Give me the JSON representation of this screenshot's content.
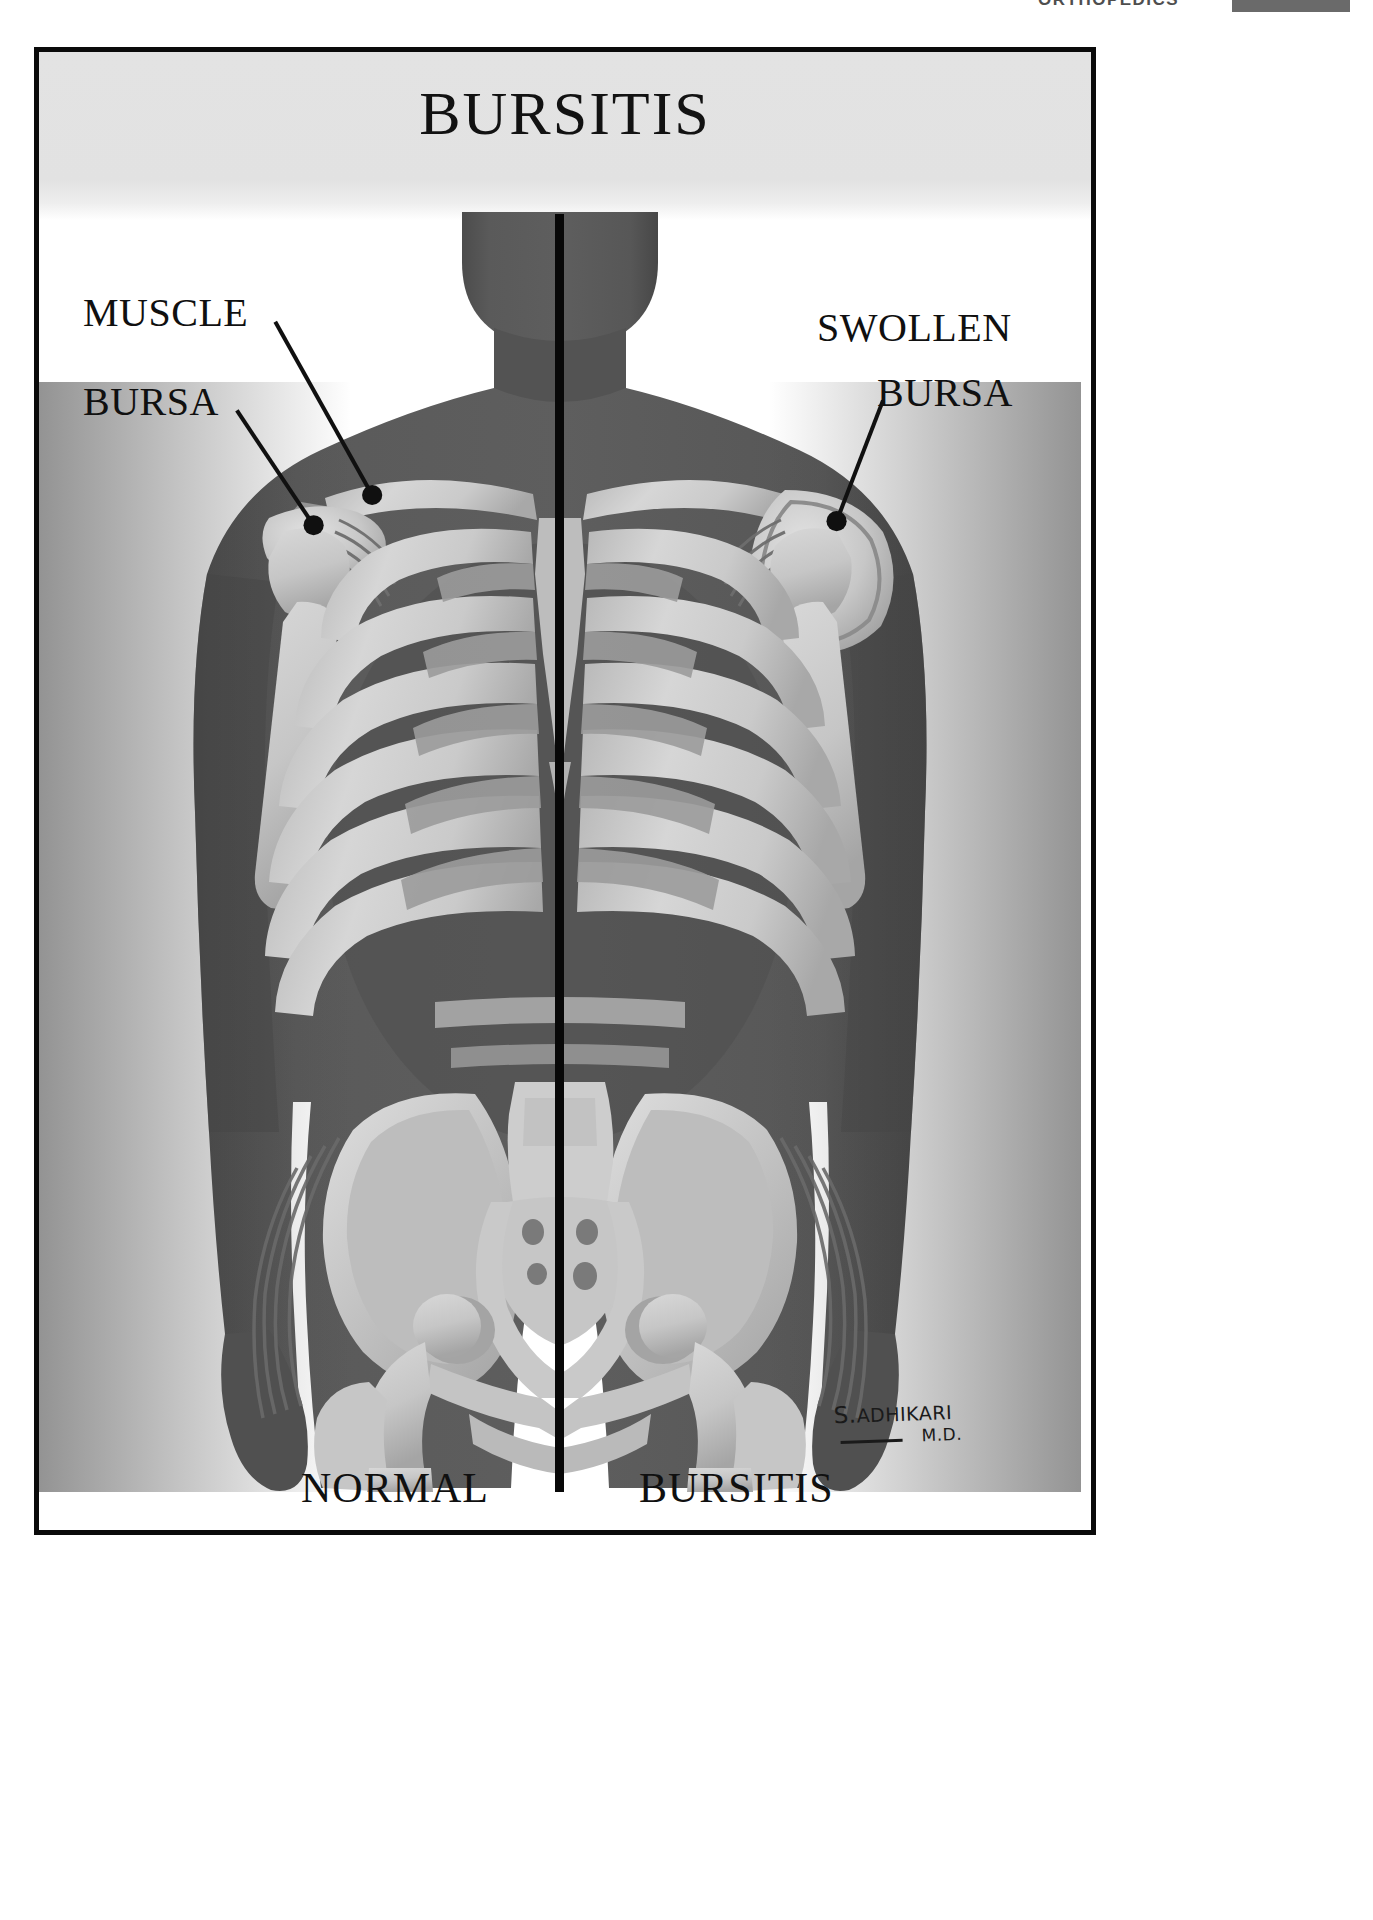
{
  "page_header": {
    "section_label": "ORTHOPEDICS",
    "page_number": "77"
  },
  "poster": {
    "title": "BURSITIS",
    "callouts": [
      {
        "id": "muscle",
        "label": "MUSCLE",
        "side": "left",
        "points_to": "deltoid-muscle"
      },
      {
        "id": "bursa",
        "label": "BURSA",
        "side": "left",
        "points_to": "normal-subacromial-bursa"
      },
      {
        "id": "swollen",
        "label": "SWOLLEN",
        "side": "right",
        "points_to": "swollen-bursa"
      },
      {
        "id": "swollen_bursa",
        "label": "BURSA",
        "side": "right",
        "points_to": "swollen-bursa"
      }
    ],
    "captions": {
      "left": "NORMAL",
      "right": "BURSITIS"
    },
    "signature": {
      "name_initial": "S.",
      "name_surname": "ADHIKARI",
      "degree": "M.D."
    }
  },
  "colors": {
    "frame": "#0a0a0a",
    "title_band": "#e2e2e2",
    "body_silhouette": "#565656",
    "body_shadow": "#3f3f3f",
    "bone_light": "#d2d2d2",
    "bone_mid": "#b6b6b6",
    "bone_dark": "#9a9a9a",
    "muscle_fiber": "#6f6f6f",
    "divider": "#080808",
    "label_text": "#101010",
    "page_background": "#ffffff"
  },
  "anatomy": {
    "divider_line": "vertical-midline",
    "left_half": "normal-anatomy",
    "right_half": "bursitis-anatomy",
    "structures": [
      "head-neck",
      "clavicle-left",
      "clavicle-right",
      "scapula-left",
      "scapula-right",
      "humerus-left",
      "humerus-right",
      "sternum",
      "ribcage",
      "pelvis",
      "sacrum",
      "femur-left",
      "femur-right",
      "bursa-normal",
      "bursa-swollen",
      "deltoid-muscle",
      "gluteal-muscle-fibers"
    ]
  }
}
